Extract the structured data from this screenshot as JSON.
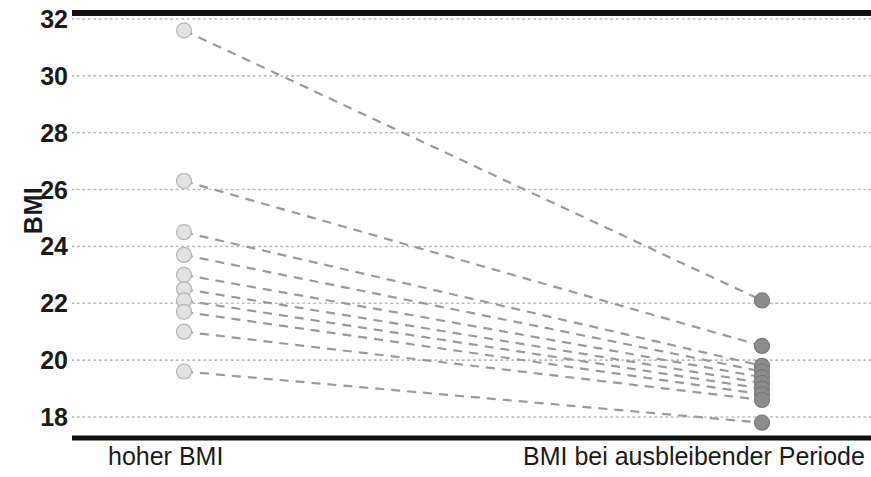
{
  "chart_data": {
    "type": "line",
    "subtype": "paired-slopegraph",
    "title": "",
    "subtitle": "",
    "xlabel": "",
    "ylabel": "BMI",
    "categories": [
      "hoher BMI",
      "BMI bei ausbleibender Periode"
    ],
    "ytick_labels": [
      "32",
      "30",
      "28",
      "26",
      "24",
      "22",
      "20",
      "18"
    ],
    "ytick_values": [
      32,
      30,
      28,
      26,
      24,
      22,
      20,
      18
    ],
    "ylim": [
      17.2,
      32.4
    ],
    "xlim": [
      0,
      1
    ],
    "grid": "horizontal-dotted",
    "legend": "none",
    "annotations": [],
    "series": [
      {
        "name": "Teilnehmerin 1",
        "values": [
          31.6,
          22.1
        ]
      },
      {
        "name": "Teilnehmerin 2",
        "values": [
          26.3,
          20.5
        ]
      },
      {
        "name": "Teilnehmerin 3",
        "values": [
          24.5,
          19.8
        ]
      },
      {
        "name": "Teilnehmerin 4",
        "values": [
          23.7,
          19.6
        ]
      },
      {
        "name": "Teilnehmerin 5",
        "values": [
          23.0,
          19.4
        ]
      },
      {
        "name": "Teilnehmerin 6",
        "values": [
          22.5,
          19.2
        ]
      },
      {
        "name": "Teilnehmerin 7",
        "values": [
          22.1,
          19.0
        ]
      },
      {
        "name": "Teilnehmerin 8",
        "values": [
          21.7,
          18.8
        ]
      },
      {
        "name": "Teilnehmerin 9",
        "values": [
          21.0,
          18.6
        ]
      },
      {
        "name": "Teilnehmerin 10",
        "values": [
          19.6,
          17.8
        ]
      }
    ],
    "colors": {
      "marker_left": "#e2e2e2",
      "marker_left_stroke": "#b5b5b5",
      "marker_right": "#8c8c8c",
      "marker_right_stroke": "#7a7a7a",
      "connector": "#9a9a9a",
      "gridline": "#b9b9b9",
      "axis": "#1a1a1a",
      "text": "#1a1a1a"
    }
  }
}
